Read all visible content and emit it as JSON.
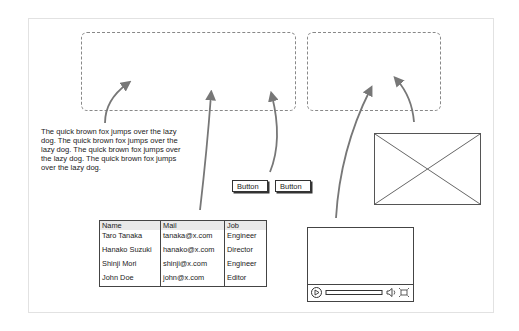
{
  "paragraph": {
    "text": "The quick brown fox jumps over the lazy dog. The quick brown fox jumps over the lazy dog. The quick brown fox jumps over the lazy dog. The quick brown fox jumps over the lazy dog."
  },
  "buttons": [
    {
      "label": "Button"
    },
    {
      "label": "Button"
    }
  ],
  "table": {
    "columns": [
      "Name",
      "Mail",
      "Job"
    ],
    "rows": [
      [
        "Taro Tanaka",
        "tanaka@x.com",
        "Engineer"
      ],
      [
        "Hanako Suzuki",
        "hanako@x.com",
        "Director"
      ],
      [
        "Shinji Mori",
        "shinji@x.com",
        "Engineer"
      ],
      [
        "John Doe",
        "john@x.com",
        "Editor"
      ]
    ]
  },
  "video_player": {
    "controls": [
      "play-icon",
      "progress-bar",
      "volume-icon",
      "fullscreen-icon"
    ]
  },
  "image_placeholder": {
    "icon": "image-placeholder-x"
  },
  "drop_zones": [
    {
      "name": "drop-zone-left"
    },
    {
      "name": "drop-zone-right"
    }
  ],
  "colors": {
    "arrow": "#777777",
    "dashed": "#888888",
    "stroke": "#444444",
    "header_bg": "#e9e9e9"
  }
}
